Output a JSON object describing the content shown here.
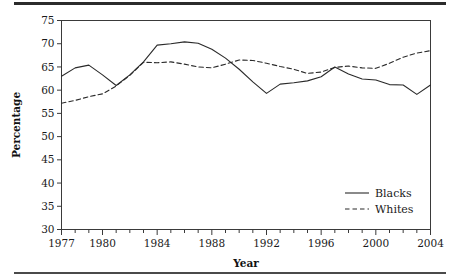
{
  "chart_data": {
    "type": "line",
    "title": "",
    "xlabel": "Year",
    "ylabel": "Percentage",
    "xlim": [
      1977,
      2004
    ],
    "ylim": [
      30,
      75
    ],
    "ytick_step": 5,
    "yticks": [
      30,
      35,
      40,
      45,
      50,
      55,
      60,
      65,
      70,
      75
    ],
    "xticks_major": [
      1977,
      1980,
      1984,
      1988,
      1992,
      1996,
      2000,
      2004
    ],
    "xticks_minor_every": 1,
    "grid": false,
    "legend_position": "bottom-right",
    "x": [
      1977,
      1978,
      1979,
      1980,
      1981,
      1982,
      1983,
      1984,
      1985,
      1986,
      1987,
      1988,
      1989,
      1990,
      1991,
      1992,
      1993,
      1994,
      1995,
      1996,
      1997,
      1998,
      1999,
      2000,
      2001,
      2002,
      2003,
      2004
    ],
    "series": [
      {
        "name": "Blacks",
        "style": "solid",
        "color": "#2a2a2a",
        "values": [
          63.0,
          64.8,
          65.4,
          63.3,
          61.0,
          63.3,
          66.1,
          69.7,
          70.0,
          70.4,
          70.1,
          68.8,
          66.9,
          64.5,
          61.8,
          59.3,
          61.3,
          61.6,
          62.0,
          62.9,
          65.0,
          63.5,
          62.4,
          62.2,
          61.2,
          61.1,
          59.1,
          61.1
        ]
      },
      {
        "name": "Whites",
        "style": "dashed",
        "color": "#2a2a2a",
        "values": [
          57.2,
          57.8,
          58.6,
          59.2,
          60.9,
          63.2,
          66.0,
          65.9,
          66.1,
          65.6,
          65.0,
          64.8,
          65.6,
          66.5,
          66.4,
          65.8,
          65.1,
          64.5,
          63.6,
          63.9,
          64.9,
          65.2,
          64.8,
          64.7,
          65.8,
          67.1,
          68.0,
          68.5
        ]
      }
    ]
  },
  "legend": {
    "items": [
      {
        "label": "Blacks",
        "style": "solid"
      },
      {
        "label": "Whites",
        "style": "dashed"
      }
    ]
  },
  "axes": {
    "y_title": "Percentage",
    "x_title": "Year"
  }
}
